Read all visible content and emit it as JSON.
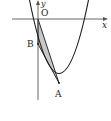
{
  "diagram": {
    "type": "parabola-coordinate-plot",
    "axes": {
      "x_label": "x",
      "y_label": "y",
      "origin_label": "O"
    },
    "points": [
      {
        "name": "O",
        "label": "O"
      },
      {
        "name": "A",
        "label": "A"
      },
      {
        "name": "B",
        "label": "B"
      }
    ],
    "shaded_region": "triangle OAB",
    "colors": {
      "stroke": "#1a1a1a",
      "shade": "#c8c8c8",
      "axis": "#555555"
    }
  }
}
